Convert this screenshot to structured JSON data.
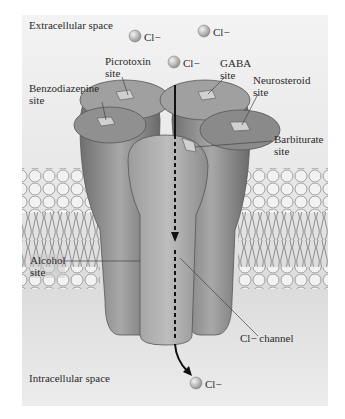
{
  "figure": {
    "type": "GABA-A receptor schematic",
    "regions": {
      "top": "Extracellular space",
      "bottom": "Intracellular space"
    },
    "ions": [
      {
        "label": "Cl−",
        "position": "extracellular-left"
      },
      {
        "label": "Cl−",
        "position": "extracellular-right"
      },
      {
        "label": "Cl−",
        "position": "entering-channel"
      },
      {
        "label": "Cl−",
        "position": "intracellular-exit"
      }
    ],
    "labels": {
      "picrotoxin": "Picrotoxin\nsite",
      "gaba": "GABA\nsite",
      "benzodiazepine": "Benzodiazepine\nsite",
      "neurosteroid": "Neurosteroid\nsite",
      "barbiturate": "Barbiturate\nsite",
      "alcohol": "Alcohol\nsite",
      "channel": "Cl− channel"
    },
    "colors": {
      "background": "#e8e8e8",
      "protein": "#8a8a8a",
      "ion": "#b5b5b5",
      "membrane": "#c8c8c8"
    }
  }
}
